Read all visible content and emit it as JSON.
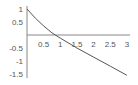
{
  "chart_data": {
    "type": "line",
    "title": "",
    "xlabel": "",
    "ylabel": "",
    "xlim": [
      0,
      3
    ],
    "ylim": [
      -1.5,
      1
    ],
    "grid": false,
    "legend": null,
    "x_ticks": [
      "0.5",
      "1",
      "1.5",
      "2",
      "2.5",
      "3"
    ],
    "y_ticks": [
      "1",
      "0.5",
      "-0.5",
      "-1",
      "-1.5"
    ],
    "series": [
      {
        "name": "f(x)",
        "color": "#555555",
        "x": [
          0,
          0.25,
          0.5,
          0.75,
          0.85,
          1,
          1.5,
          2,
          2.5,
          3
        ],
        "y": [
          1,
          0.65,
          0.35,
          0.08,
          0,
          -0.12,
          -0.5,
          -0.85,
          -1.2,
          -1.55
        ]
      }
    ]
  }
}
